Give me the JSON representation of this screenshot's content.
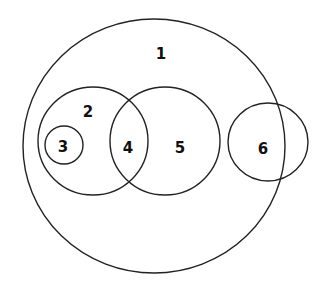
{
  "diagram": {
    "type": "euler-venn",
    "stroke_color": "#222222",
    "background": "#ffffff",
    "circles": [
      {
        "id": "1",
        "label": "1",
        "cx": 154,
        "cy": 146,
        "rx": 131,
        "ry": 127,
        "label_x": 161,
        "label_y": 54
      },
      {
        "id": "2",
        "label": "2",
        "cx": 93,
        "cy": 141,
        "rx": 55,
        "ry": 54,
        "label_x": 88,
        "label_y": 112
      },
      {
        "id": "3",
        "label": "3",
        "cx": 64,
        "cy": 145,
        "rx": 19,
        "ry": 19,
        "label_x": 63,
        "label_y": 147
      },
      {
        "id": "5",
        "label": "5",
        "cx": 165,
        "cy": 141,
        "rx": 55,
        "ry": 54,
        "label_x": 180,
        "label_y": 148
      },
      {
        "id": "6",
        "label": "6",
        "cx": 268,
        "cy": 142,
        "rx": 40,
        "ry": 39,
        "label_x": 263,
        "label_y": 149
      }
    ],
    "region_labels": [
      {
        "id": "4",
        "label": "4",
        "x": 128,
        "y": 148,
        "description": "intersection of circle 2 and circle 5"
      }
    ]
  }
}
